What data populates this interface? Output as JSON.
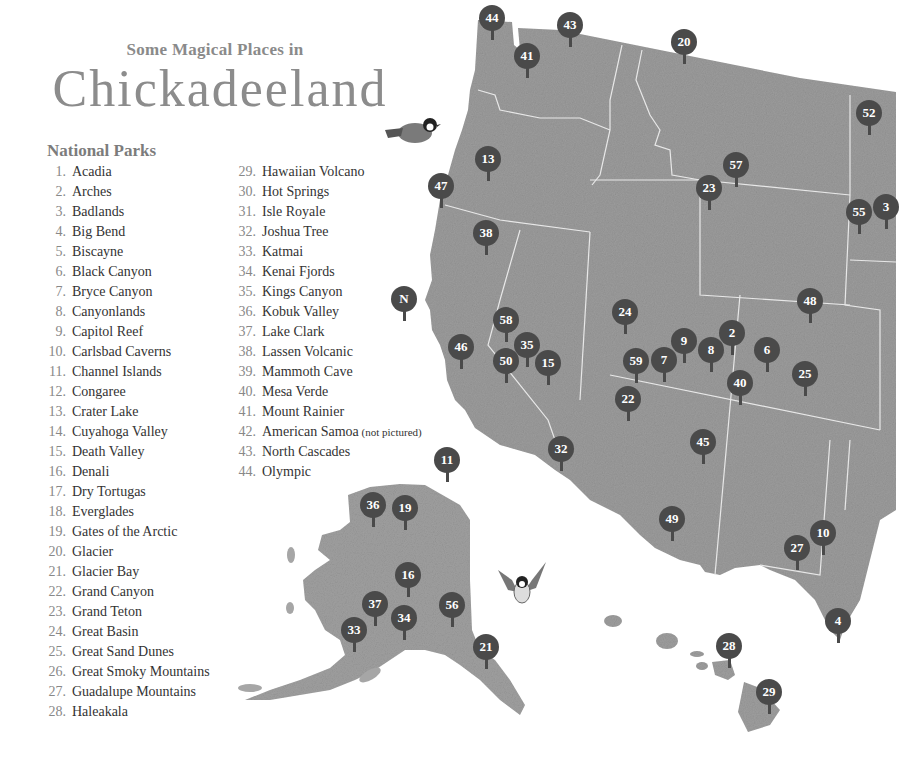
{
  "header": {
    "subtitle": "Some Magical Places in",
    "title": "Chickadeeland"
  },
  "legend": {
    "heading": "National Parks",
    "columns": [
      [
        {
          "num": "1.",
          "name": "Acadia"
        },
        {
          "num": "2.",
          "name": "Arches"
        },
        {
          "num": "3.",
          "name": "Badlands"
        },
        {
          "num": "4.",
          "name": "Big Bend"
        },
        {
          "num": "5.",
          "name": "Biscayne"
        },
        {
          "num": "6.",
          "name": "Black Canyon"
        },
        {
          "num": "7.",
          "name": "Bryce Canyon"
        },
        {
          "num": "8.",
          "name": "Canyonlands"
        },
        {
          "num": "9.",
          "name": "Capitol Reef"
        },
        {
          "num": "10.",
          "name": "Carlsbad Caverns"
        },
        {
          "num": "11.",
          "name": "Channel Islands"
        },
        {
          "num": "12.",
          "name": "Congaree"
        },
        {
          "num": "13.",
          "name": "Crater Lake"
        },
        {
          "num": "14.",
          "name": "Cuyahoga Valley"
        },
        {
          "num": "15.",
          "name": "Death Valley"
        },
        {
          "num": "16.",
          "name": "Denali"
        },
        {
          "num": "17.",
          "name": "Dry Tortugas"
        },
        {
          "num": "18.",
          "name": "Everglades"
        },
        {
          "num": "19.",
          "name": "Gates of the Arctic"
        },
        {
          "num": "20.",
          "name": "Glacier"
        },
        {
          "num": "21.",
          "name": "Glacier Bay"
        },
        {
          "num": "22.",
          "name": "Grand Canyon"
        },
        {
          "num": "23.",
          "name": "Grand Teton"
        },
        {
          "num": "24.",
          "name": "Great Basin"
        },
        {
          "num": "25.",
          "name": "Great Sand Dunes"
        },
        {
          "num": "26.",
          "name": "Great Smoky Mountains"
        },
        {
          "num": "27.",
          "name": "Guadalupe Mountains"
        },
        {
          "num": "28.",
          "name": "Haleakala"
        }
      ],
      [
        {
          "num": "29.",
          "name": "Hawaiian Volcano"
        },
        {
          "num": "30.",
          "name": "Hot Springs"
        },
        {
          "num": "31.",
          "name": "Isle Royale"
        },
        {
          "num": "32.",
          "name": "Joshua Tree"
        },
        {
          "num": "33.",
          "name": "Katmai"
        },
        {
          "num": "34.",
          "name": "Kenai Fjords"
        },
        {
          "num": "35.",
          "name": "Kings Canyon"
        },
        {
          "num": "36.",
          "name": "Kobuk Valley"
        },
        {
          "num": "37.",
          "name": "Lake Clark"
        },
        {
          "num": "38.",
          "name": "Lassen Volcanic"
        },
        {
          "num": "39.",
          "name": "Mammoth Cave"
        },
        {
          "num": "40.",
          "name": "Mesa Verde"
        },
        {
          "num": "41.",
          "name": "Mount Rainier"
        },
        {
          "num": "42.",
          "name": "American Samoa",
          "note": "(not pictured)"
        },
        {
          "num": "43.",
          "name": "North Cascades"
        },
        {
          "num": "44.",
          "name": "Olympic"
        }
      ]
    ]
  },
  "map": {
    "land_color": "#9a9a9a",
    "marker_color": "#4a4a4a",
    "markers": [
      {
        "label": "44",
        "x": 492,
        "y": 18
      },
      {
        "label": "43",
        "x": 570,
        "y": 25
      },
      {
        "label": "41",
        "x": 527,
        "y": 56
      },
      {
        "label": "20",
        "x": 684,
        "y": 42
      },
      {
        "label": "52",
        "x": 869,
        "y": 113
      },
      {
        "label": "13",
        "x": 488,
        "y": 159
      },
      {
        "label": "47",
        "x": 441,
        "y": 186
      },
      {
        "label": "57",
        "x": 736,
        "y": 165
      },
      {
        "label": "23",
        "x": 709,
        "y": 188
      },
      {
        "label": "55",
        "x": 859,
        "y": 212
      },
      {
        "label": "3",
        "x": 886,
        "y": 207
      },
      {
        "label": "38",
        "x": 486,
        "y": 233
      },
      {
        "label": "N",
        "x": 404,
        "y": 299
      },
      {
        "label": "48",
        "x": 810,
        "y": 301
      },
      {
        "label": "24",
        "x": 625,
        "y": 312
      },
      {
        "label": "58",
        "x": 506,
        "y": 320
      },
      {
        "label": "2",
        "x": 732,
        "y": 333
      },
      {
        "label": "9",
        "x": 684,
        "y": 341
      },
      {
        "label": "35",
        "x": 527,
        "y": 345
      },
      {
        "label": "46",
        "x": 461,
        "y": 347
      },
      {
        "label": "8",
        "x": 711,
        "y": 350
      },
      {
        "label": "6",
        "x": 767,
        "y": 350
      },
      {
        "label": "50",
        "x": 506,
        "y": 361
      },
      {
        "label": "15",
        "x": 548,
        "y": 363
      },
      {
        "label": "59",
        "x": 636,
        "y": 361
      },
      {
        "label": "7",
        "x": 664,
        "y": 360
      },
      {
        "label": "25",
        "x": 805,
        "y": 374
      },
      {
        "label": "40",
        "x": 740,
        "y": 383
      },
      {
        "label": "22",
        "x": 628,
        "y": 399
      },
      {
        "label": "45",
        "x": 703,
        "y": 442
      },
      {
        "label": "11",
        "x": 447,
        "y": 460
      },
      {
        "label": "32",
        "x": 561,
        "y": 449
      },
      {
        "label": "36",
        "x": 373,
        "y": 505
      },
      {
        "label": "19",
        "x": 405,
        "y": 508
      },
      {
        "label": "49",
        "x": 672,
        "y": 519
      },
      {
        "label": "10",
        "x": 823,
        "y": 533
      },
      {
        "label": "27",
        "x": 797,
        "y": 548
      },
      {
        "label": "16",
        "x": 408,
        "y": 575
      },
      {
        "label": "37",
        "x": 375,
        "y": 604
      },
      {
        "label": "56",
        "x": 452,
        "y": 605
      },
      {
        "label": "34",
        "x": 404,
        "y": 618
      },
      {
        "label": "33",
        "x": 354,
        "y": 630
      },
      {
        "label": "4",
        "x": 838,
        "y": 621
      },
      {
        "label": "28",
        "x": 729,
        "y": 646
      },
      {
        "label": "21",
        "x": 486,
        "y": 647
      },
      {
        "label": "29",
        "x": 769,
        "y": 692
      }
    ]
  }
}
